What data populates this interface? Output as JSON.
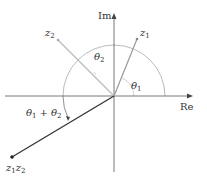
{
  "diagram": {
    "axes": {
      "real_label": "Re",
      "imag_label": "Im"
    },
    "points": {
      "z1": {
        "label_base": "z",
        "label_sub": "1"
      },
      "z2": {
        "label_base": "z",
        "label_sub": "2"
      },
      "product": {
        "label_base1": "z",
        "label_sub1": "1",
        "label_base2": "z",
        "label_sub2": "2"
      }
    },
    "angles": {
      "theta1": {
        "base": "θ",
        "sub": "1"
      },
      "theta2": {
        "base": "θ",
        "sub": "2"
      },
      "sum": {
        "base1": "θ",
        "sub1": "1",
        "plus": "+",
        "base2": "θ",
        "sub2": "2"
      }
    },
    "colors": {
      "axis": "#444444",
      "z1_line": "#999999",
      "z2_line": "#bbbbbb",
      "product_line": "#333333",
      "arc": "#aaaaaa",
      "text": "#333333"
    }
  }
}
